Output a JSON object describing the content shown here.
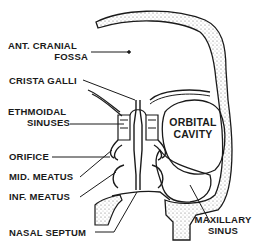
{
  "diagram": {
    "colors": {
      "ink": "#1a1a1a",
      "bone_stipple": "#555555",
      "background": "#ffffff"
    },
    "labels": {
      "ant_cranial_fossa_1": "ANT. CRANIAL",
      "ant_cranial_fossa_2": "FOSSA",
      "crista_galli": "CRISTA GALLI",
      "ethmoidal_sinuses_1": "ETHMOIDAL",
      "ethmoidal_sinuses_2": "SINUSES",
      "orifice": "ORIFICE",
      "mid_meatus": "MID. MEATUS",
      "inf_meatus": "INF. MEATUS",
      "nasal_septum": "NASAL SEPTUM",
      "orbital_cavity_1": "ORBITAL",
      "orbital_cavity_2": "CAVITY",
      "maxillary_sinus_1": "MAXILLARY",
      "maxillary_sinus_2": "SINUS"
    }
  }
}
